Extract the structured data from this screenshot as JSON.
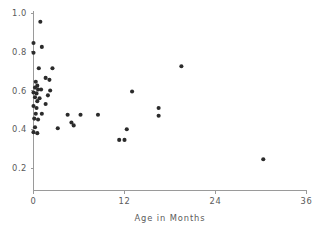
{
  "chart_data": {
    "type": "scatter",
    "title": "",
    "subtitle": "",
    "xlabel": "Age in Months",
    "ylabel": "",
    "xlim": [
      0,
      36
    ],
    "ylim": [
      0.1,
      1.03
    ],
    "xticks": [
      0,
      12,
      24,
      36
    ],
    "xticklabels": [
      "0",
      "12",
      "24",
      "36"
    ],
    "yticks": [
      0.2,
      0.4,
      0.6,
      0.8,
      1.0
    ],
    "yticklabels": [
      "0.2",
      "0.4",
      "0.6",
      "0.8",
      "1.0"
    ],
    "grid": false,
    "legend": null,
    "legend_position": "none",
    "marker": "filled-circle",
    "marker_color": "#2b2b2b",
    "axis_color": "#9a9a9a",
    "text_color": "#5a5a5a",
    "annotations": [],
    "points": [
      {
        "x": 0.9,
        "y": 0.955
      },
      {
        "x": 0.0,
        "y": 0.845
      },
      {
        "x": 1.1,
        "y": 0.825
      },
      {
        "x": 0.0,
        "y": 0.795
      },
      {
        "x": 0.7,
        "y": 0.715
      },
      {
        "x": 2.5,
        "y": 0.715
      },
      {
        "x": 1.6,
        "y": 0.665
      },
      {
        "x": 2.1,
        "y": 0.655
      },
      {
        "x": 0.3,
        "y": 0.645
      },
      {
        "x": 0.5,
        "y": 0.625
      },
      {
        "x": 0.2,
        "y": 0.615
      },
      {
        "x": 0.6,
        "y": 0.605
      },
      {
        "x": 1.0,
        "y": 0.605
      },
      {
        "x": 2.2,
        "y": 0.6
      },
      {
        "x": 0.0,
        "y": 0.59
      },
      {
        "x": 0.4,
        "y": 0.585
      },
      {
        "x": 1.9,
        "y": 0.575
      },
      {
        "x": 0.2,
        "y": 0.565
      },
      {
        "x": 0.8,
        "y": 0.56
      },
      {
        "x": 13.0,
        "y": 0.595
      },
      {
        "x": 0.5,
        "y": 0.545
      },
      {
        "x": 1.6,
        "y": 0.53
      },
      {
        "x": 0.0,
        "y": 0.52
      },
      {
        "x": 0.4,
        "y": 0.51
      },
      {
        "x": 19.5,
        "y": 0.725
      },
      {
        "x": 16.5,
        "y": 0.51
      },
      {
        "x": 16.5,
        "y": 0.47
      },
      {
        "x": 0.3,
        "y": 0.48
      },
      {
        "x": 1.1,
        "y": 0.48
      },
      {
        "x": 4.5,
        "y": 0.475
      },
      {
        "x": 6.2,
        "y": 0.475
      },
      {
        "x": 8.5,
        "y": 0.475
      },
      {
        "x": 0.1,
        "y": 0.455
      },
      {
        "x": 0.6,
        "y": 0.45
      },
      {
        "x": 5.0,
        "y": 0.435
      },
      {
        "x": 5.3,
        "y": 0.42
      },
      {
        "x": 0.2,
        "y": 0.41
      },
      {
        "x": 3.2,
        "y": 0.405
      },
      {
        "x": 12.3,
        "y": 0.4
      },
      {
        "x": 0.0,
        "y": 0.385
      },
      {
        "x": 0.5,
        "y": 0.38
      },
      {
        "x": 11.3,
        "y": 0.345
      },
      {
        "x": 12.0,
        "y": 0.345
      },
      {
        "x": 30.3,
        "y": 0.245
      }
    ]
  }
}
